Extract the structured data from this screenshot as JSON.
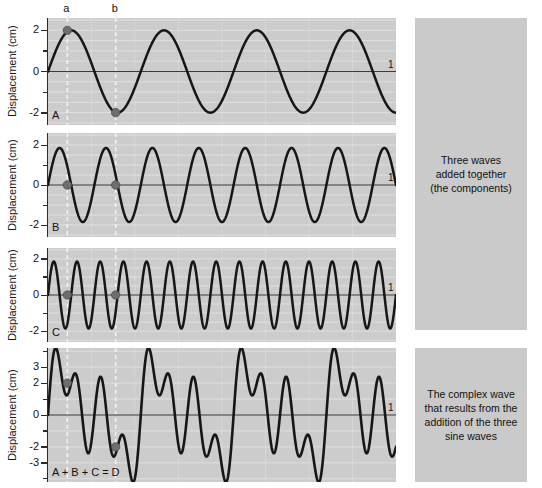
{
  "figure": {
    "ylabel": "Displacement (cm)",
    "vertical_markers": [
      {
        "label": "a",
        "x_fraction": 0.0556
      },
      {
        "label": "b",
        "x_fraction": 0.1944
      }
    ],
    "end_axis_label": "1",
    "colors": {
      "plot_background": "#cccccc",
      "caption_background": "#cacaca",
      "wave_stroke": "#161616",
      "axis": "#3a3a3a",
      "gridline": "#e3e3e3",
      "marker_fill": "#6e6e6e",
      "dashed_guide": "#f2f2f2",
      "page_background": "#ffffff"
    }
  },
  "panels": [
    {
      "letter": "A",
      "ytick_labels": [
        "2",
        "0",
        "-2"
      ],
      "ytick_values": [
        2,
        0,
        -2
      ],
      "ylim": [
        -2.6,
        2.6
      ],
      "marker_points": [
        {
          "guide": "a",
          "value": 2
        },
        {
          "guide": "b",
          "value": -2
        }
      ]
    },
    {
      "letter": "B",
      "ytick_labels": [
        "2",
        "0",
        "-2"
      ],
      "ytick_values": [
        2,
        0,
        -2
      ],
      "ylim": [
        -2.6,
        2.6
      ],
      "marker_points": [
        {
          "guide": "a",
          "value": 0
        },
        {
          "guide": "b",
          "value": 0
        }
      ]
    },
    {
      "letter": "C",
      "ytick_labels": [
        "2",
        "0",
        "-2"
      ],
      "ytick_values": [
        2,
        0,
        -2
      ],
      "ylim": [
        -2.6,
        2.6
      ],
      "marker_points": [
        {
          "guide": "a",
          "value": 0
        },
        {
          "guide": "b",
          "value": 0
        }
      ]
    },
    {
      "letter": "A + B + C = D",
      "ytick_labels": [
        "3",
        "2",
        "0",
        "-2",
        "-3"
      ],
      "ytick_values": [
        3,
        2,
        0,
        -2,
        -3
      ],
      "ylim": [
        -4.2,
        4.2
      ],
      "marker_points": [
        {
          "guide": "a",
          "value": 2
        },
        {
          "guide": "b",
          "value": -2
        }
      ]
    }
  ],
  "captions": [
    {
      "id": "components-caption",
      "text": "Three waves\nadded together\n(the components)"
    },
    {
      "id": "complex-wave-caption",
      "text": "The complex wave\nthat results from the\naddition of the three\nsine waves"
    }
  ],
  "chart_data": {
    "type": "line",
    "title": "",
    "xlabel": "",
    "ylabel": "Displacement (cm)",
    "xlim": [
      0,
      1
    ],
    "grid": true,
    "legend": "none",
    "x_guides": [
      {
        "label": "a",
        "x": 0.0556
      },
      {
        "label": "b",
        "x": 0.1944
      }
    ],
    "series": [
      {
        "name": "A",
        "waveform": "sine",
        "amplitude": 2.0,
        "cycles": 3.75,
        "phase_deg": 0,
        "ylim": [
          -2.6,
          2.6
        ],
        "yticks": [
          2,
          0,
          -2
        ],
        "sampled_points": [
          {
            "x": 0.0,
            "y": 0.0
          },
          {
            "x": 0.0556,
            "y": 2.0
          },
          {
            "x": 0.1389,
            "y": 0.0
          },
          {
            "x": 0.1944,
            "y": -2.0
          },
          {
            "x": 0.2778,
            "y": 0.0
          },
          {
            "x": 0.3333,
            "y": 2.0
          },
          {
            "x": 0.4167,
            "y": 0.0
          },
          {
            "x": 0.4722,
            "y": -2.0
          },
          {
            "x": 0.5556,
            "y": 0.0
          },
          {
            "x": 0.6111,
            "y": 2.0
          },
          {
            "x": 0.6944,
            "y": 0.0
          },
          {
            "x": 0.75,
            "y": -2.0
          },
          {
            "x": 0.8333,
            "y": 0.0
          },
          {
            "x": 0.8889,
            "y": 2.0
          },
          {
            "x": 0.9722,
            "y": 0.0
          },
          {
            "x": 1.0,
            "y": -1.4
          }
        ]
      },
      {
        "name": "B",
        "waveform": "sine",
        "amplitude": 1.85,
        "cycles": 7.5,
        "phase_deg": 0,
        "ylim": [
          -2.6,
          2.6
        ],
        "yticks": [
          2,
          0,
          -2
        ],
        "sampled_points": [
          {
            "x": 0.0,
            "y": 0.0
          },
          {
            "x": 0.0333,
            "y": 1.85
          },
          {
            "x": 0.0556,
            "y": 0.0
          },
          {
            "x": 0.1,
            "y": -1.85
          },
          {
            "x": 0.1333,
            "y": 0.0
          },
          {
            "x": 0.1667,
            "y": 1.85
          },
          {
            "x": 0.1944,
            "y": 0.0
          },
          {
            "x": 0.2333,
            "y": -1.85
          },
          {
            "x": 0.3,
            "y": 1.85
          },
          {
            "x": 0.4333,
            "y": 1.85
          },
          {
            "x": 0.5667,
            "y": 1.85
          },
          {
            "x": 0.7,
            "y": 1.85
          },
          {
            "x": 0.8333,
            "y": 1.85
          },
          {
            "x": 0.9667,
            "y": 1.85
          },
          {
            "x": 1.0,
            "y": 0.0
          }
        ]
      },
      {
        "name": "C",
        "waveform": "sine",
        "amplitude": 1.85,
        "cycles": 15,
        "phase_deg": 0,
        "ylim": [
          -2.6,
          2.6
        ],
        "yticks": [
          2,
          0,
          -2
        ],
        "sampled_points": [
          {
            "x": 0.0,
            "y": 0.0
          },
          {
            "x": 0.0167,
            "y": 1.85
          },
          {
            "x": 0.0333,
            "y": 0.0
          },
          {
            "x": 0.05,
            "y": -1.85
          },
          {
            "x": 0.0556,
            "y": 0.0
          },
          {
            "x": 0.0833,
            "y": 1.85
          },
          {
            "x": 0.1944,
            "y": 0.0
          },
          {
            "x": 0.25,
            "y": 1.85
          },
          {
            "x": 0.5,
            "y": 0.0
          },
          {
            "x": 0.75,
            "y": 1.85
          },
          {
            "x": 1.0,
            "y": 0.0
          }
        ]
      },
      {
        "name": "D",
        "waveform": "sum",
        "components": [
          "A",
          "B",
          "C"
        ],
        "amplitude_range": [
          -3.9,
          3.9
        ],
        "ylim": [
          -4.2,
          4.2
        ],
        "yticks": [
          3,
          2,
          0,
          -2,
          -3
        ],
        "sampled_points": [
          {
            "x": 0.0,
            "y": 0.0
          },
          {
            "x": 0.0167,
            "y": 3.6
          },
          {
            "x": 0.0389,
            "y": 1.3
          },
          {
            "x": 0.0556,
            "y": 2.0
          },
          {
            "x": 0.0722,
            "y": 1.2
          },
          {
            "x": 0.1,
            "y": -2.3
          },
          {
            "x": 0.1278,
            "y": 2.6
          },
          {
            "x": 0.1611,
            "y": -0.2
          },
          {
            "x": 0.1944,
            "y": -2.0
          },
          {
            "x": 0.2111,
            "y": -1.6
          },
          {
            "x": 0.2333,
            "y": -3.8
          },
          {
            "x": 0.2611,
            "y": 3.7
          },
          {
            "x": 0.2889,
            "y": 1.5
          },
          {
            "x": 0.3056,
            "y": 2.3
          },
          {
            "x": 0.3333,
            "y": -2.2
          },
          {
            "x": 0.3722,
            "y": 2.5
          },
          {
            "x": 0.4056,
            "y": -2.6
          },
          {
            "x": 0.4444,
            "y": 1.0
          },
          {
            "x": 0.4722,
            "y": -3.8
          },
          {
            "x": 0.5,
            "y": 3.6
          },
          {
            "x": 0.5333,
            "y": 1.4
          },
          {
            "x": 0.5556,
            "y": 2.1
          },
          {
            "x": 0.5889,
            "y": -2.4
          },
          {
            "x": 0.6222,
            "y": 2.6
          },
          {
            "x": 0.6556,
            "y": -1.0
          },
          {
            "x": 0.6944,
            "y": -2.2
          },
          {
            "x": 0.7222,
            "y": -3.8
          },
          {
            "x": 0.75,
            "y": 3.7
          },
          {
            "x": 0.7833,
            "y": 1.4
          },
          {
            "x": 0.8056,
            "y": 2.2
          },
          {
            "x": 0.8333,
            "y": -2.2
          },
          {
            "x": 0.8667,
            "y": 2.5
          },
          {
            "x": 0.9,
            "y": -1.2
          },
          {
            "x": 0.9333,
            "y": -1.5
          },
          {
            "x": 0.9611,
            "y": -3.8
          },
          {
            "x": 1.0,
            "y": 0.2
          }
        ]
      }
    ]
  }
}
